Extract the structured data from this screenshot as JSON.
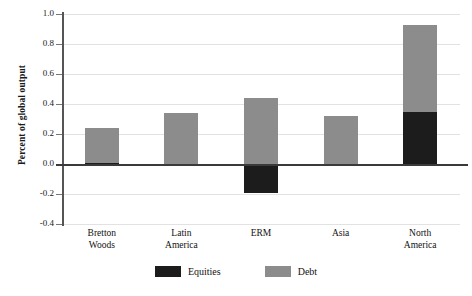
{
  "chart_data": {
    "type": "bar",
    "title": "",
    "subtitle": "",
    "xlabel": "",
    "ylabel": "Percent of global output",
    "categories": [
      "Bretton\nWoods",
      "Latin\nAmerica",
      "ERM",
      "Asia",
      "North\nAmerica"
    ],
    "category_lines": [
      [
        "Bretton",
        "Woods"
      ],
      [
        "Latin",
        "America"
      ],
      [
        "ERM",
        ""
      ],
      [
        "Asia",
        ""
      ],
      [
        "North",
        "America"
      ]
    ],
    "series": [
      {
        "name": "Equities",
        "color": "#1c1c1c",
        "values": [
          0.01,
          0.0,
          -0.19,
          -0.015,
          0.35
        ]
      },
      {
        "name": "Debt",
        "color": "#8c8c8c",
        "values": [
          0.23,
          0.34,
          0.44,
          0.32,
          0.58
        ]
      }
    ],
    "stacked": true,
    "totals_positive": [
      0.24,
      0.34,
      0.44,
      0.32,
      0.93
    ],
    "ylim": [
      -0.4,
      1.0
    ],
    "yticks": [
      1.0,
      0.8,
      0.6,
      0.4,
      0.2,
      0.0,
      -0.2,
      -0.4
    ],
    "ytick_labels": [
      "1.0",
      "0.8",
      "0.6",
      "0.4",
      "0.2",
      "0.0",
      "-0.2",
      "-0.4"
    ],
    "grid": true,
    "legend_position": "bottom",
    "legend": [
      {
        "label": "Equities",
        "color": "#1c1c1c"
      },
      {
        "label": "Debt",
        "color": "#8c8c8c"
      }
    ],
    "zero_line": 0.0
  },
  "colors": {
    "equities": "#1c1c1c",
    "debt": "#8c8c8c",
    "grid": "#e2e2e2",
    "axis": "#3a3a3a",
    "background": "#ffffff"
  }
}
